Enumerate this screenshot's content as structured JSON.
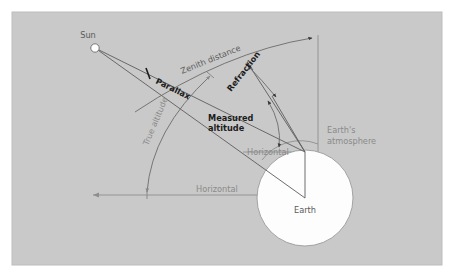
{
  "figure": {
    "panel": {
      "x": 12,
      "y": 12,
      "width": 430,
      "height": 253,
      "fill": "#c9c9c9",
      "border": "#b4b4b4"
    },
    "background_color": "#ffffff"
  },
  "colors": {
    "panel": "#c9c9c9",
    "ray": "#5c5c5c",
    "guide": "#8e8e8e",
    "arc": "#6b6b6b",
    "bold_text": "#1c1c1c",
    "gray_text": "#8a8a8a",
    "body_fill": "#fdfdfd",
    "sun_fill": "#ffffff"
  },
  "bodies": {
    "sun": {
      "label": "Sun",
      "cx": 95,
      "cy": 48,
      "r": 4.2,
      "label_x": 88,
      "label_y": 37
    },
    "earth": {
      "label": "Earth",
      "cx": 305,
      "cy": 198,
      "r": 48,
      "label_x": 305,
      "label_y": 212
    },
    "observer": {
      "x": 305,
      "y": 152
    }
  },
  "labels": {
    "parallax": "Parallax",
    "zenith_distance": "Zenith distance",
    "refraction": "Refraction",
    "measured_altitude_line1": "Measured",
    "measured_altitude_line2": "altitude",
    "true_altitude": "True altitude",
    "horizontal_upper": "Horizontal",
    "horizontal_lower": "Horizontal",
    "earths_atmosphere_line1": "Earth's",
    "earths_atmosphere_line2": "atmosphere",
    "sun": "Sun",
    "earth": "Earth"
  },
  "geometry": {
    "zenith_line": {
      "x": 318,
      "y_top": 35,
      "y_bottom": 155
    },
    "horizontal_lower": {
      "x1": 93,
      "x2": 305,
      "y": 195
    },
    "horizontal_upper": {
      "x1": 243,
      "x2": 305,
      "y": 152
    },
    "ray_measured": {
      "x1": 95,
      "y1": 48,
      "x2": 305,
      "y2": 152
    },
    "ray_apparent": {
      "x1": 95,
      "y1": 48,
      "x2": 305,
      "y2": 198
    },
    "ray_refracted_upper": {
      "x1": 247,
      "y1": 62,
      "x2": 305,
      "y2": 152
    },
    "ray_refracted_mid": {
      "x1": 272,
      "y1": 95,
      "x2": 305,
      "y2": 152
    },
    "zenith_arc": {
      "from_x": 125,
      "from_y": 105,
      "to_x": 314,
      "to_y": 37
    },
    "true_altitude_arc": {
      "from_x": 147,
      "from_y": 193,
      "to_x": 211,
      "to_y": 74
    },
    "refraction_arc": {
      "from_x": 249,
      "from_y": 68,
      "to_x": 278,
      "to_y": 99
    },
    "measured_altitude_arc": {
      "from_x": 268,
      "from_y": 102,
      "to_x": 279,
      "to_y": 148
    }
  }
}
